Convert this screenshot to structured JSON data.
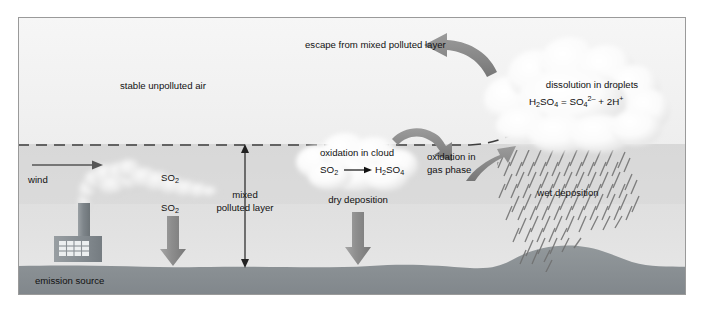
{
  "figure": {
    "frame": {
      "x": 18,
      "y": 17,
      "width": 668,
      "height": 278,
      "border_color": "#9a9a9a",
      "sky_upper_color": "#f3f3f3",
      "sky_lower_color": "#d9d9d9",
      "ground_color": "#8e9396",
      "cloud_color": "#fbfbfb",
      "arrow_color": "#8a8a8a",
      "line_color": "#4a4a4a"
    },
    "labels": {
      "stable_air": "stable unpolluted air",
      "escape": "escape from mixed polluted layer",
      "dissolution": "dissolution in droplets",
      "wind": "wind",
      "so2_plume": "SO2",
      "so2_dry": "SO2",
      "mixed_layer_line1": "mixed",
      "mixed_layer_line2": "polluted layer",
      "oxidation_cloud": "oxidation in cloud",
      "oxidation_gas_line1": "oxidation in",
      "oxidation_gas_line2": "gas phase",
      "dry_deposition": "dry deposition",
      "wet_deposition": "wet deposition",
      "emission_source": "emission source"
    },
    "equations": {
      "dissolution": {
        "full": "H2SO4 = SO4 2- + 2H+",
        "reactant": "H",
        "reactant_sub1": "2",
        "reactant_mid": "SO",
        "reactant_sub2": "4",
        "equals": "=",
        "product1": "SO",
        "product1_sub": "4",
        "product1_sup": "2–",
        "plus": "+",
        "product2_coeff": "2",
        "product2": "H",
        "product2_sup": "+"
      },
      "cloud_oxidation": {
        "full": "SO2 → H2SO4",
        "reactant": "SO",
        "reactant_sub": "2",
        "arrow": "→",
        "product_h": "H",
        "product_sub1": "2",
        "product_so": "SO",
        "product_sub2": "4"
      }
    },
    "arrows": [
      {
        "name": "wind-arrow",
        "kind": "thin-horizontal",
        "direction": "right"
      },
      {
        "name": "mixed-layer-extent-arrow",
        "kind": "thin-vertical",
        "direction": "both"
      },
      {
        "name": "so2-dry-arrow",
        "kind": "block-vertical",
        "direction": "down"
      },
      {
        "name": "dry-deposition-arrow",
        "kind": "block-vertical",
        "direction": "down"
      },
      {
        "name": "escape-arrow",
        "kind": "curved-block",
        "direction": "left"
      },
      {
        "name": "cloud-to-gas-phase-arrow",
        "kind": "curved-block",
        "direction": "right-down"
      },
      {
        "name": "gas-phase-to-cloud-arrow",
        "kind": "curved-block",
        "direction": "right-up"
      }
    ]
  }
}
